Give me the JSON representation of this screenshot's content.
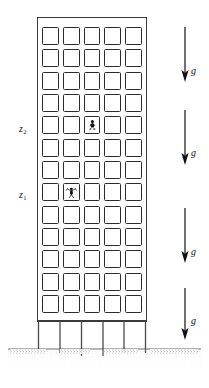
{
  "figure": {
    "type": "engineering-schematic",
    "width": 209,
    "height": 388,
    "background_color": "#ffffff",
    "line_color": "#2b2b2b"
  },
  "building": {
    "name": "multi-storey-building",
    "window_columns": 5,
    "window_rows": 13,
    "outline_color": "#3a3a3a",
    "window_border_color": "#2b2b2b",
    "occupants": [
      {
        "label": "upper-occupant",
        "row": 5,
        "column": 3,
        "pose": "seated"
      },
      {
        "label": "lower-occupant",
        "row": 8,
        "column": 2,
        "pose": "arms-raised"
      }
    ],
    "stilts": {
      "count": 6,
      "color": "#4a4a4a"
    }
  },
  "elevations": [
    {
      "id": "z2",
      "symbol": "z",
      "subscript": "2",
      "text": "z"
    },
    {
      "id": "z1",
      "symbol": "z",
      "subscript": "1",
      "text": "z"
    }
  ],
  "gravity": {
    "symbol": "g",
    "direction": "down",
    "arrow_color": "#111111",
    "arrows": [
      {
        "id": "g-arrow-1",
        "label": "g"
      },
      {
        "id": "g-arrow-2",
        "label": "g"
      },
      {
        "id": "g-arrow-3",
        "label": "g"
      },
      {
        "id": "g-arrow-4",
        "label": "g"
      }
    ]
  },
  "ground": {
    "name": "soil-ground",
    "pattern": "stipple",
    "color": "#2a2a2a",
    "surface_line_color": "#3a3a3a"
  }
}
